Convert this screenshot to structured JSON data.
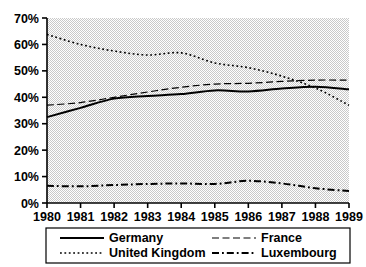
{
  "chart_data": {
    "type": "line",
    "title": "",
    "subtitle": "",
    "xlabel": "",
    "ylabel": "",
    "x": [
      1980,
      1981,
      1982,
      1983,
      1984,
      1985,
      1986,
      1987,
      1988,
      1989
    ],
    "categories": [
      "1980",
      "1981",
      "1982",
      "1983",
      "1984",
      "1985",
      "1986",
      "1987",
      "1988",
      "1989"
    ],
    "xlim": [
      1980,
      1989
    ],
    "ylim": [
      0,
      70
    ],
    "y_ticks": [
      0,
      10,
      20,
      30,
      40,
      50,
      60,
      70
    ],
    "y_tick_labels": [
      "0%",
      "10%",
      "20%",
      "30%",
      "40%",
      "50%",
      "60%",
      "70%"
    ],
    "x_tick_labels": [
      "1980",
      "1981",
      "1982",
      "1983",
      "1984",
      "1985",
      "1986",
      "1987",
      "1988",
      "1989"
    ],
    "grid": false,
    "legend_position": "bottom",
    "series": [
      {
        "name": "Germany",
        "style": "solid",
        "color": "#000000",
        "width": 2.0,
        "values": [
          32.5,
          36.0,
          39.5,
          40.5,
          41.2,
          42.6,
          42.2,
          43.3,
          44.0,
          43.0
        ]
      },
      {
        "name": "France",
        "style": "dashed",
        "color": "#000000",
        "width": 1.2,
        "values": [
          37.0,
          38.0,
          40.0,
          42.0,
          43.8,
          45.0,
          45.3,
          46.0,
          46.5,
          46.5
        ]
      },
      {
        "name": "United Kingdom",
        "style": "dotted",
        "color": "#000000",
        "width": 1.6,
        "values": [
          63.8,
          60.0,
          57.5,
          56.0,
          56.8,
          53.0,
          51.2,
          48.0,
          43.5,
          37.0
        ]
      },
      {
        "name": "Luxembourg",
        "style": "dashdot",
        "color": "#000000",
        "width": 2.0,
        "values": [
          6.5,
          6.3,
          6.8,
          7.2,
          7.4,
          7.2,
          8.4,
          7.4,
          5.6,
          4.5
        ]
      }
    ],
    "legend_entries": [
      {
        "label": "Germany",
        "style": "solid"
      },
      {
        "label": "France",
        "style": "dashed"
      },
      {
        "label": "United Kingdom",
        "style": "dotted"
      },
      {
        "label": "Luxembourg",
        "style": "dashdot"
      }
    ],
    "colors": {
      "plot_background": "#e8e8e8",
      "axis": "#000000",
      "text": "#000000",
      "page_background": "#ffffff",
      "legend_border": "#000000"
    }
  }
}
